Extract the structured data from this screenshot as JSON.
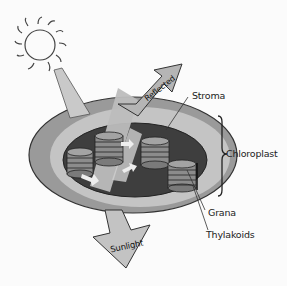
{
  "diagram": {
    "labels": {
      "stroma": "Stroma",
      "chloroplast": "Chloroplast",
      "grana": "Grana",
      "thylakoids": "Thylakoids",
      "reflected": "Reflected",
      "sunlight": "Sunlight"
    },
    "icons": [
      "sun-icon",
      "light-beam",
      "reflected-arrow",
      "sunlight-arrow",
      "grana-stack",
      "brace"
    ],
    "colors": {
      "outer_membrane": "#9a9a9a",
      "inner_band": "#c4c4c4",
      "stroma": "#3e3e3e",
      "grana": "#8c8c8c",
      "beam": "#bdbdbd",
      "background": "#fbfbfb"
    }
  }
}
